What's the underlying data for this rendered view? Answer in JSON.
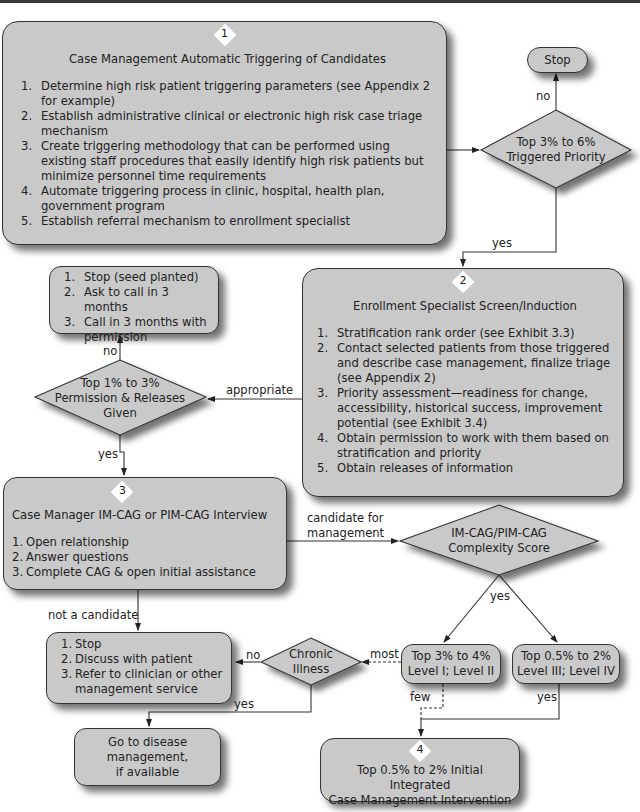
{
  "diagram": {
    "box1": {
      "number": "1",
      "title": "Case Management Automatic Triggering of Candidates",
      "items": [
        {
          "n": "1.",
          "text": "Determine high risk patient triggering parameters (see Appendix 2 for example)"
        },
        {
          "n": "2.",
          "text": "Establish administrative clinical or electronic high risk case triage mechanism"
        },
        {
          "n": "3.",
          "text": "Create triggering methodology that can be performed using existing staff procedures that easily identify high risk patients but minimize personnel time requirements"
        },
        {
          "n": "4.",
          "text": "Automate triggering process in clinic, hospital, health plan, government program"
        },
        {
          "n": "5.",
          "text": "Establish referral mechanism to enrollment specialist"
        }
      ]
    },
    "stop_top": {
      "label": "Stop"
    },
    "decision_triggered": {
      "line1": "Top 3% to 6%",
      "line2": "Triggered Priority"
    },
    "box2": {
      "number": "2",
      "title": "Enrollment Specialist Screen/Induction",
      "items": [
        {
          "n": "1.",
          "text": "Stratification rank order (see Exhibit 3.3)"
        },
        {
          "n": "2.",
          "text": "Contact selected patients from those triggered and describe case management, finalize triage (see Appendix 2)"
        },
        {
          "n": "3.",
          "text": "Priority assessment—readiness for change, accessibility, historical success, improvement potential (see Exhibit 3.4)"
        },
        {
          "n": "4.",
          "text": "Obtain permission to work with them based on stratification and priority"
        },
        {
          "n": "5.",
          "text": "Obtain releases of information"
        }
      ]
    },
    "seed_box": {
      "items": [
        {
          "n": "1.",
          "text": "Stop (seed planted)"
        },
        {
          "n": "2.",
          "text": "Ask to call in 3 months"
        },
        {
          "n": "3.",
          "text": "Call in 3 months with permission"
        }
      ]
    },
    "decision_permission": {
      "line1": "Top 1% to 3%",
      "line2": "Permission & Releases",
      "line3": "Given"
    },
    "box3": {
      "number": "3",
      "title": "Case Manager IM-CAG or PIM-CAG Interview",
      "items": [
        {
          "n": "1.",
          "text": "Open relationship"
        },
        {
          "n": "2.",
          "text": "Answer questions"
        },
        {
          "n": "3.",
          "text": "Complete CAG & open initial assistance"
        }
      ]
    },
    "decision_complexity": {
      "line1": "IM-CAG/PIM-CAG",
      "line2": "Complexity Score"
    },
    "level12_box": {
      "line1": "Top 3% to 4%",
      "line2": "Level I; Level II"
    },
    "level34_box": {
      "line1": "Top 0.5% to 2%",
      "line2": "Level III; Level IV"
    },
    "decision_chronic": {
      "line1": "Chronic",
      "line2": "Illness"
    },
    "stop_box": {
      "items": [
        {
          "n": "1.",
          "text": "Stop"
        },
        {
          "n": "2.",
          "text": "Discuss with patient"
        },
        {
          "n": "3.",
          "text": "Refer to clinician or other management service"
        }
      ]
    },
    "disease_box": {
      "line1": "Go to disease",
      "line2": "management,",
      "line3": "if available"
    },
    "box4": {
      "number": "4",
      "line1": "Top 0.5% to 2% Initial Integrated",
      "line2": "Case Management Intervention"
    },
    "edge_labels": {
      "no_top": "no",
      "yes_triggered": "yes",
      "appropriate": "appropriate",
      "no_permission": "no",
      "yes_permission": "yes",
      "candidate_line1": "candidate for",
      "candidate_line2": "management",
      "not_candidate": "not a candidate",
      "yes_complexity": "yes",
      "most": "most",
      "few": "few",
      "yes_level34": "yes",
      "no_chronic": "no",
      "yes_chronic": "yes"
    },
    "colors": {
      "fill": "#c9c9c9",
      "stroke": "#333333",
      "badge": "#ffffff",
      "background": "#ffffff"
    }
  }
}
